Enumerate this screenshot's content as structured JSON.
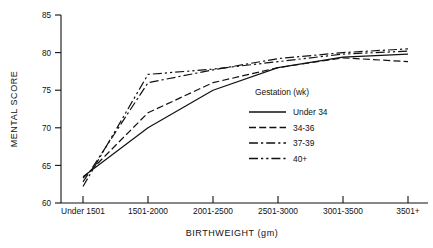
{
  "chart_data": {
    "type": "line",
    "title": "",
    "xlabel": "BIRTHWEIGHT (gm)",
    "ylabel": "MENTAL SCORE",
    "categories": [
      "Under 1501",
      "1501-2000",
      "2001-2500",
      "2501-3000",
      "3001-3500",
      "3501+"
    ],
    "ylim": [
      60,
      85
    ],
    "yticks": [
      60,
      65,
      70,
      75,
      80,
      85
    ],
    "ytick_labels": [
      "60",
      "65",
      "70",
      "75",
      "80",
      "85"
    ],
    "grid": false,
    "legend_position": "inside-right",
    "legend_title": "Gestation (wk)",
    "series": [
      {
        "name": "Under 34",
        "style": "solid",
        "values": [
          63.5,
          70.0,
          75.0,
          78.0,
          79.4,
          79.8
        ]
      },
      {
        "name": "34-36",
        "style": "dashed",
        "values": [
          63.3,
          72.0,
          76.0,
          78.0,
          79.3,
          78.8
        ]
      },
      {
        "name": "37-39",
        "style": "dash-dot",
        "values": [
          62.8,
          76.0,
          77.7,
          79.2,
          80.0,
          80.5
        ]
      },
      {
        "name": "40+",
        "style": "dash-dot-dot",
        "values": [
          62.2,
          77.1,
          77.8,
          78.8,
          79.8,
          80.2
        ]
      }
    ]
  },
  "axes": {
    "y_title": "MENTAL SCORE",
    "x_title": "BIRTHWEIGHT (gm)",
    "y_tick_0": "60",
    "y_tick_1": "65",
    "y_tick_2": "70",
    "y_tick_3": "75",
    "y_tick_4": "80",
    "y_tick_5": "85",
    "x_tick_0": "Under 1501",
    "x_tick_1": "1501-2000",
    "x_tick_2": "2001-2500",
    "x_tick_3": "2501-3000",
    "x_tick_4": "3001-3500",
    "x_tick_5": "3501+"
  },
  "legend": {
    "title": "Gestation (wk)",
    "items": [
      {
        "label": "Under 34"
      },
      {
        "label": "34-36"
      },
      {
        "label": "37-39"
      },
      {
        "label": "40+"
      }
    ]
  },
  "colors": {
    "ink": "#111111",
    "background": "#ffffff"
  }
}
